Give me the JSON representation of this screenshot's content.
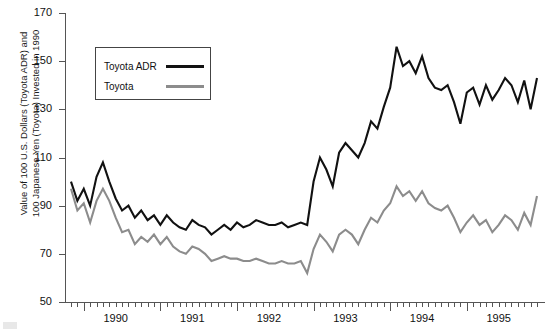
{
  "axes": {
    "ylabel": "Value of 100 U.S. Dollars (Toyota ADR) and\n100 Japanese Yen (Toyota) Invested in 1990",
    "ytick_labels": [
      "170",
      "150",
      "130",
      "110",
      "90",
      "70",
      "50"
    ],
    "xtick_labels": [
      "1990",
      "1991",
      "1992",
      "1993",
      "1994",
      "1995"
    ]
  },
  "legend": {
    "items": [
      {
        "label": "Toyota ADR",
        "color": "#111111"
      },
      {
        "label": "Toyota",
        "color": "#8c8c8c"
      }
    ]
  },
  "chart_data": {
    "type": "line",
    "title": "",
    "xlabel": "",
    "ylabel": "Value of 100 U.S. Dollars (Toyota ADR) and 100 Japanese Yen (Toyota) Invested in 1990",
    "ylim": [
      50,
      170
    ],
    "yticks": [
      50,
      70,
      90,
      110,
      130,
      150,
      170
    ],
    "xlim": [
      "1989-11",
      "1995-12"
    ],
    "xticks": [
      "1990",
      "1991",
      "1992",
      "1993",
      "1994",
      "1995"
    ],
    "grid": false,
    "legend_position": "upper-left",
    "x": [
      "1989-11",
      "1989-12",
      "1990-01",
      "1990-02",
      "1990-03",
      "1990-04",
      "1990-05",
      "1990-06",
      "1990-07",
      "1990-08",
      "1990-09",
      "1990-10",
      "1990-11",
      "1990-12",
      "1991-01",
      "1991-02",
      "1991-03",
      "1991-04",
      "1991-05",
      "1991-06",
      "1991-07",
      "1991-08",
      "1991-09",
      "1991-10",
      "1991-11",
      "1991-12",
      "1992-01",
      "1992-02",
      "1992-03",
      "1992-04",
      "1992-05",
      "1992-06",
      "1992-07",
      "1992-08",
      "1992-09",
      "1992-10",
      "1992-11",
      "1992-12",
      "1993-01",
      "1993-02",
      "1993-03",
      "1993-04",
      "1993-05",
      "1993-06",
      "1993-07",
      "1993-08",
      "1993-09",
      "1993-10",
      "1993-11",
      "1993-12",
      "1994-01",
      "1994-02",
      "1994-03",
      "1994-04",
      "1994-05",
      "1994-06",
      "1994-07",
      "1994-08",
      "1994-09",
      "1994-10",
      "1994-11",
      "1994-12",
      "1995-01",
      "1995-02",
      "1995-03",
      "1995-04",
      "1995-05",
      "1995-06",
      "1995-07",
      "1995-08",
      "1995-09",
      "1995-10",
      "1995-11",
      "1995-12"
    ],
    "series": [
      {
        "name": "Toyota ADR",
        "color": "#111111",
        "values": [
          100,
          92,
          97,
          90,
          102,
          108,
          100,
          93,
          88,
          90,
          85,
          88,
          84,
          86,
          82,
          86,
          83,
          81,
          80,
          84,
          82,
          81,
          78,
          80,
          82,
          80,
          83,
          81,
          82,
          84,
          83,
          82,
          82,
          83,
          81,
          82,
          83,
          82,
          100,
          110,
          105,
          98,
          112,
          116,
          113,
          110,
          116,
          125,
          122,
          131,
          139,
          156,
          148,
          150,
          145,
          152,
          143,
          139,
          138,
          140,
          133,
          124,
          137,
          139,
          132,
          140,
          134,
          138,
          143,
          140,
          133,
          142,
          130,
          143
        ]
      },
      {
        "name": "Toyota",
        "color": "#8c8c8c",
        "values": [
          97,
          88,
          91,
          83,
          92,
          97,
          92,
          85,
          79,
          80,
          74,
          77,
          75,
          78,
          74,
          77,
          73,
          71,
          70,
          73,
          72,
          70,
          67,
          68,
          69,
          68,
          68,
          67,
          67,
          68,
          67,
          66,
          66,
          67,
          66,
          66,
          67,
          62,
          72,
          78,
          75,
          71,
          78,
          80,
          78,
          74,
          80,
          85,
          83,
          88,
          91,
          98,
          94,
          96,
          92,
          96,
          91,
          89,
          88,
          90,
          85,
          79,
          83,
          86,
          82,
          84,
          79,
          82,
          86,
          84,
          80,
          87,
          82,
          94
        ]
      }
    ]
  }
}
